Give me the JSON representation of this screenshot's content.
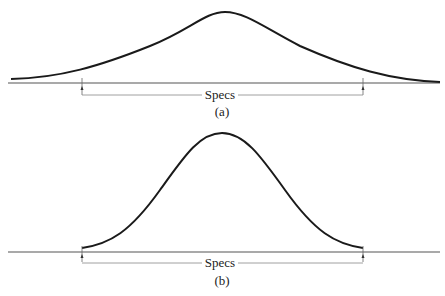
{
  "panels": [
    {
      "id": "a",
      "caption": "(a)",
      "spec_label": "Specs",
      "description": "Wide distribution extending beyond spec limits"
    },
    {
      "id": "b",
      "caption": "(b)",
      "spec_label": "Specs",
      "description": "Narrow distribution fitting within spec limits"
    }
  ],
  "colors": {
    "curve": "#1a1a1a",
    "axis": "#555555",
    "bracket": "#888888"
  }
}
